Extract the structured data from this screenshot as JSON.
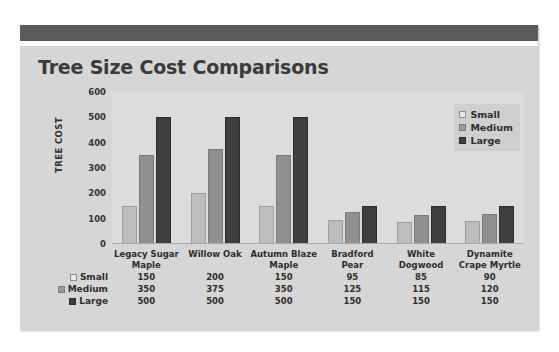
{
  "slide": {
    "title": "Tree Size Cost Comparisons"
  },
  "legend": {
    "items": [
      {
        "label": "Small",
        "swatch": "small-swatch-icon",
        "color": "#e8e8e8"
      },
      {
        "label": "Medium",
        "swatch": "medium-swatch-icon",
        "color": "#9a9a9a"
      },
      {
        "label": "Large",
        "swatch": "large-swatch-icon",
        "color": "#3f3f3f"
      }
    ]
  },
  "axis": {
    "y_title": "TREE COST",
    "y_ticks": [
      "600",
      "500",
      "400",
      "300",
      "200",
      "100",
      "0"
    ]
  },
  "chart_data": {
    "type": "bar",
    "title": "Tree Size Cost Comparisons",
    "xlabel": "",
    "ylabel": "TREE COST",
    "ylim": [
      0,
      600
    ],
    "ytick_step": 100,
    "grid": false,
    "legend_position": "top-right-inside",
    "categories": [
      "Legacy Sugar Maple",
      "Willow Oak",
      "Autumn Blaze Maple",
      "Bradford Pear",
      "White Dogwood",
      "Dynamite Crape Myrtle"
    ],
    "category_lines": [
      [
        "Legacy Sugar",
        "Maple"
      ],
      [
        "Willow Oak",
        ""
      ],
      [
        "Autumn Blaze",
        "Maple"
      ],
      [
        "Bradford Pear",
        ""
      ],
      [
        "White",
        "Dogwood"
      ],
      [
        "Dynamite",
        "Crape Myrtle"
      ]
    ],
    "series": [
      {
        "name": "Small",
        "color": "#bdbdbd",
        "values": [
          150,
          200,
          150,
          95,
          85,
          90
        ]
      },
      {
        "name": "Medium",
        "color": "#909090",
        "values": [
          350,
          375,
          350,
          125,
          115,
          120
        ]
      },
      {
        "name": "Large",
        "color": "#3f3f3f",
        "values": [
          500,
          500,
          500,
          150,
          150,
          150
        ]
      }
    ]
  },
  "data_table": {
    "row_labels": [
      "Small",
      "Medium",
      "Large"
    ],
    "rows": [
      [
        "150",
        "200",
        "150",
        "95",
        "85",
        "90"
      ],
      [
        "350",
        "375",
        "350",
        "125",
        "115",
        "120"
      ],
      [
        "500",
        "500",
        "500",
        "150",
        "150",
        "150"
      ]
    ]
  }
}
